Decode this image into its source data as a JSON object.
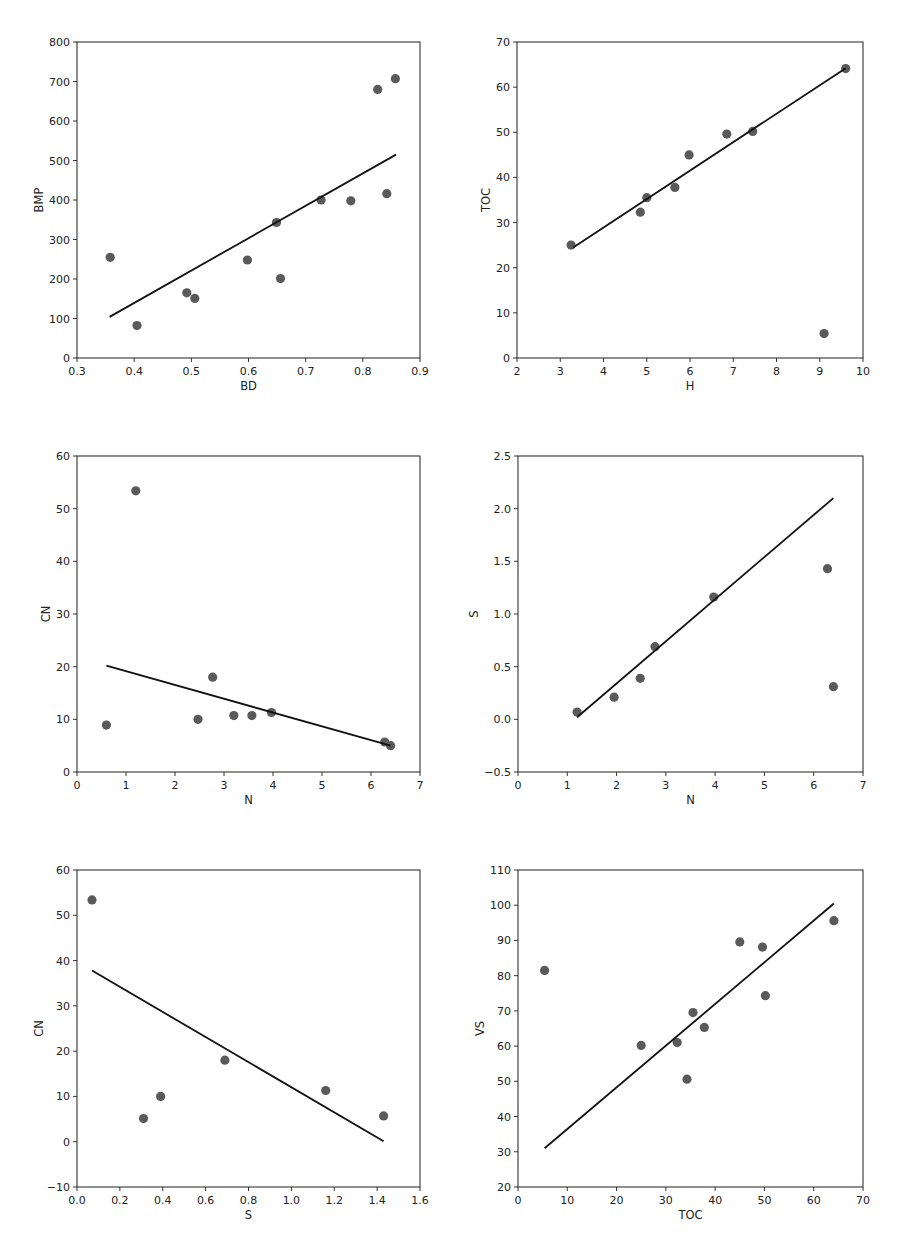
{
  "figure": {
    "width": 900,
    "height": 1236,
    "background": "#ffffff",
    "marker_color": "#5a5a5a",
    "line_color": "#111111",
    "frame_color": "#333333"
  },
  "chart_data": [
    {
      "id": "bd-bmp",
      "type": "scatter",
      "title": "",
      "xlabel": "BD",
      "ylabel": "BMP",
      "xlim": [
        0.3,
        0.9
      ],
      "ylim": [
        0,
        800
      ],
      "xticks": [
        0.3,
        0.4,
        0.5,
        0.6,
        0.7,
        0.8,
        0.9
      ],
      "xtick_labels": [
        "0.3",
        "0.4",
        "0.5",
        "0.6",
        "0.7",
        "0.8",
        "0.9"
      ],
      "yticks": [
        0,
        100,
        200,
        300,
        400,
        500,
        600,
        700,
        800
      ],
      "ytick_labels": [
        "0",
        "100",
        "200",
        "300",
        "400",
        "500",
        "600",
        "700",
        "800"
      ],
      "grid": false,
      "legend": null,
      "box": {
        "left": 77,
        "top": 42,
        "right": 420,
        "bottom": 358
      },
      "series": [
        {
          "name": "observations",
          "kind": "scatter",
          "x": [
            0.358,
            0.405,
            0.492,
            0.506,
            0.598,
            0.649,
            0.656,
            0.727,
            0.779,
            0.826,
            0.842,
            0.857
          ],
          "y": [
            255,
            82,
            165,
            151,
            248,
            343,
            201,
            400,
            398,
            680,
            416,
            707
          ]
        },
        {
          "name": "linear fit",
          "kind": "line",
          "x": [
            0.357,
            0.858
          ],
          "y": [
            104,
            515
          ]
        }
      ]
    },
    {
      "id": "h-toc",
      "type": "scatter",
      "title": "",
      "xlabel": "H",
      "ylabel": "TOC",
      "xlim": [
        2,
        10
      ],
      "ylim": [
        0,
        70
      ],
      "xticks": [
        2,
        3,
        4,
        5,
        6,
        7,
        8,
        9,
        10
      ],
      "xtick_labels": [
        "2",
        "3",
        "4",
        "5",
        "6",
        "7",
        "8",
        "9",
        "10"
      ],
      "yticks": [
        0,
        10,
        20,
        30,
        40,
        50,
        60,
        70
      ],
      "ytick_labels": [
        "0",
        "10",
        "20",
        "30",
        "40",
        "50",
        "60",
        "70"
      ],
      "grid": false,
      "legend": null,
      "box": {
        "left": 517,
        "top": 42,
        "right": 863,
        "bottom": 358
      },
      "series": [
        {
          "name": "observations",
          "kind": "scatter",
          "x": [
            3.25,
            4.85,
            5.0,
            5.65,
            5.98,
            6.85,
            7.45,
            9.6,
            9.1
          ],
          "y": [
            25.0,
            32.3,
            35.5,
            37.8,
            45.0,
            49.6,
            50.2,
            64.1,
            5.4
          ]
        },
        {
          "name": "linear fit",
          "kind": "line",
          "x": [
            3.3,
            9.6
          ],
          "y": [
            24.5,
            64.2
          ]
        }
      ]
    },
    {
      "id": "n-cn",
      "type": "scatter",
      "title": "",
      "xlabel": "N",
      "ylabel": "CN",
      "xlim": [
        0,
        7
      ],
      "ylim": [
        0,
        60
      ],
      "xticks": [
        0,
        1,
        2,
        3,
        4,
        5,
        6,
        7
      ],
      "xtick_labels": [
        "0",
        "1",
        "2",
        "3",
        "4",
        "5",
        "6",
        "7"
      ],
      "yticks": [
        0,
        10,
        20,
        30,
        40,
        50,
        60
      ],
      "ytick_labels": [
        "0",
        "10",
        "20",
        "30",
        "40",
        "50",
        "60"
      ],
      "grid": false,
      "legend": null,
      "box": {
        "left": 77,
        "top": 456,
        "right": 420,
        "bottom": 772
      },
      "series": [
        {
          "name": "observations",
          "kind": "scatter",
          "x": [
            0.6,
            1.2,
            2.47,
            2.77,
            3.2,
            3.57,
            3.97,
            6.28,
            6.4
          ],
          "y": [
            8.9,
            53.4,
            10.0,
            18.0,
            10.7,
            10.7,
            11.3,
            5.7,
            5.0
          ]
        },
        {
          "name": "linear fit",
          "kind": "line",
          "x": [
            0.6,
            6.4
          ],
          "y": [
            20.2,
            5.0
          ]
        }
      ]
    },
    {
      "id": "n-s",
      "type": "scatter",
      "title": "",
      "xlabel": "N",
      "ylabel": "S",
      "xlim": [
        0,
        7
      ],
      "ylim": [
        -0.5,
        2.5
      ],
      "xticks": [
        0,
        1,
        2,
        3,
        4,
        5,
        6,
        7
      ],
      "xtick_labels": [
        "0",
        "1",
        "2",
        "3",
        "4",
        "5",
        "6",
        "7"
      ],
      "yticks": [
        -0.5,
        0.0,
        0.5,
        1.0,
        1.5,
        2.0,
        2.5
      ],
      "ytick_labels": [
        "−0.5",
        "0.0",
        "0.5",
        "1.0",
        "1.5",
        "2.0",
        "2.5"
      ],
      "grid": false,
      "legend": null,
      "box": {
        "left": 518,
        "top": 456,
        "right": 863,
        "bottom": 772
      },
      "series": [
        {
          "name": "observations",
          "kind": "scatter",
          "x": [
            1.2,
            1.95,
            2.48,
            2.78,
            3.97,
            6.28,
            6.4
          ],
          "y": [
            0.07,
            0.21,
            0.39,
            0.69,
            1.16,
            1.43,
            0.31
          ]
        },
        {
          "name": "linear fit",
          "kind": "line",
          "x": [
            1.2,
            6.4
          ],
          "y": [
            0.02,
            2.1
          ]
        }
      ]
    },
    {
      "id": "s-cn",
      "type": "scatter",
      "title": "",
      "xlabel": "S",
      "ylabel": "CN",
      "xlim": [
        0.0,
        1.6
      ],
      "ylim": [
        -10,
        60
      ],
      "xticks": [
        0.0,
        0.2,
        0.4,
        0.6,
        0.8,
        1.0,
        1.2,
        1.4,
        1.6
      ],
      "xtick_labels": [
        "0.0",
        "0.2",
        "0.4",
        "0.6",
        "0.8",
        "1.0",
        "1.2",
        "1.4",
        "1.6"
      ],
      "yticks": [
        -10,
        0,
        10,
        20,
        30,
        40,
        50,
        60
      ],
      "ytick_labels": [
        "−10",
        "0",
        "10",
        "20",
        "30",
        "40",
        "50",
        "60"
      ],
      "grid": false,
      "legend": null,
      "box": {
        "left": 77,
        "top": 870,
        "right": 420,
        "bottom": 1187
      },
      "series": [
        {
          "name": "observations",
          "kind": "scatter",
          "x": [
            0.07,
            0.31,
            0.39,
            0.69,
            1.16,
            1.43
          ],
          "y": [
            53.4,
            5.1,
            10.0,
            18.0,
            11.3,
            5.7
          ]
        },
        {
          "name": "linear fit",
          "kind": "line",
          "x": [
            0.07,
            1.43
          ],
          "y": [
            37.8,
            0.1
          ]
        }
      ]
    },
    {
      "id": "toc-vs",
      "type": "scatter",
      "title": "",
      "xlabel": "TOC",
      "ylabel": "VS",
      "xlim": [
        0,
        70
      ],
      "ylim": [
        20,
        110
      ],
      "xticks": [
        0,
        10,
        20,
        30,
        40,
        50,
        60,
        70
      ],
      "xtick_labels": [
        "0",
        "10",
        "20",
        "30",
        "40",
        "50",
        "60",
        "70"
      ],
      "yticks": [
        20,
        30,
        40,
        50,
        60,
        70,
        80,
        90,
        100,
        110
      ],
      "ytick_labels": [
        "20",
        "30",
        "40",
        "50",
        "60",
        "70",
        "80",
        "90",
        "100",
        "110"
      ],
      "grid": false,
      "legend": null,
      "box": {
        "left": 518,
        "top": 870,
        "right": 863,
        "bottom": 1187
      },
      "series": [
        {
          "name": "observations",
          "kind": "scatter",
          "x": [
            5.4,
            25.0,
            32.3,
            34.3,
            35.5,
            37.8,
            45.0,
            49.6,
            50.2,
            64.1
          ],
          "y": [
            81.5,
            60.2,
            61.0,
            50.6,
            69.5,
            65.3,
            89.6,
            88.1,
            74.3,
            95.6
          ]
        },
        {
          "name": "linear fit",
          "kind": "line",
          "x": [
            5.4,
            64.1
          ],
          "y": [
            31.0,
            100.5
          ]
        }
      ]
    }
  ]
}
